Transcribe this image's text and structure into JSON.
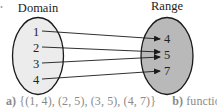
{
  "diagram": {
    "domain_title": "Domain",
    "range_title": "Range",
    "domain_values": [
      "1",
      "2",
      "3",
      "4"
    ],
    "range_values": [
      "4",
      "5",
      "7"
    ],
    "mappings": [
      {
        "from": "1",
        "to": "4"
      },
      {
        "from": "2",
        "to": "5"
      },
      {
        "from": "3",
        "to": "5"
      },
      {
        "from": "4",
        "to": "7"
      }
    ],
    "colors": {
      "domain_fill": "#ececec",
      "range_fill": "#b9b9b9",
      "stroke": "#1a1a1a",
      "caption": "#8a8a8a"
    }
  },
  "caption": {
    "a_label": "a)",
    "a_text": "{(1, 4), (2, 5), (3, 5), (4, 7)}",
    "b_label": "b)",
    "b_text": "function"
  }
}
